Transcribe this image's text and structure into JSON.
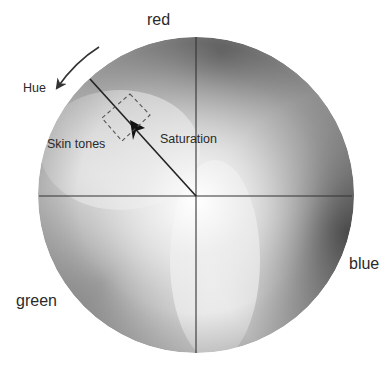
{
  "diagram": {
    "type": "color-wheel",
    "labels": {
      "top": "red",
      "right": "blue",
      "left": "green",
      "hue": "Hue",
      "saturation": "Saturation",
      "skin_tones": "Skin tones"
    },
    "wheel": {
      "center": [
        196,
        195
      ],
      "radius": 158,
      "axes": "crosshair"
    },
    "arrows": [
      {
        "name": "hue",
        "direction": "counter-clockwise"
      },
      {
        "name": "saturation",
        "direction": "outward from center"
      }
    ],
    "region": {
      "name": "skin-tones",
      "style": "dashed box"
    }
  }
}
